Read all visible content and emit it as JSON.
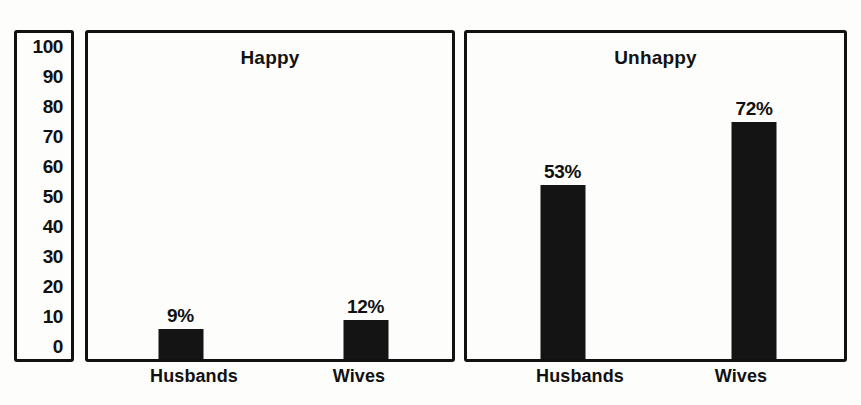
{
  "chart_data": {
    "type": "bar",
    "title": "",
    "xlabel": "",
    "ylabel": "",
    "ylim": [
      0,
      100
    ],
    "grid": false,
    "legend": "none",
    "y_ticks": [
      "100",
      "90",
      "80",
      "70",
      "60",
      "50",
      "40",
      "30",
      "20",
      "10",
      "0"
    ],
    "categories": [
      "Husbands",
      "Wives"
    ],
    "panels": [
      {
        "title": "Happy",
        "bars": [
          {
            "category": "Husbands",
            "value": 9,
            "label": "9%"
          },
          {
            "category": "Wives",
            "value": 12,
            "label": "12%"
          }
        ]
      },
      {
        "title": "Unhappy",
        "bars": [
          {
            "category": "Husbands",
            "value": 53,
            "label": "53%"
          },
          {
            "category": "Wives",
            "value": 72,
            "label": "72%"
          }
        ]
      }
    ],
    "colors": {
      "bar": "#141414",
      "border": "#111111",
      "background": "#fdfdfc",
      "text": "#111111"
    }
  }
}
